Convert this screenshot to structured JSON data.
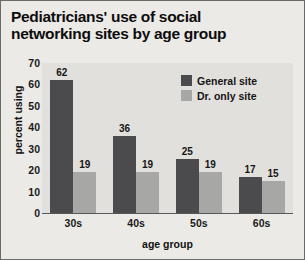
{
  "chart_data": {
    "type": "bar",
    "title": "Pediatricians' use of social networking sites by age group",
    "title_line1": "Pediatricians' use of social",
    "title_line2": "networking sites by age group",
    "xlabel": "age group",
    "ylabel": "percent using",
    "categories": [
      "30s",
      "40s",
      "50s",
      "60s"
    ],
    "series": [
      {
        "name": "General site",
        "color": "#4b4b4d",
        "values": [
          62,
          36,
          25,
          17
        ]
      },
      {
        "name": "Dr. only site",
        "color": "#a7a7a6",
        "values": [
          19,
          19,
          19,
          15
        ]
      }
    ],
    "ylim": [
      0,
      70
    ],
    "yticks": [
      70,
      60,
      50,
      40,
      30,
      20,
      10,
      0
    ],
    "grid": false,
    "legend_position": "top-right",
    "value_labels": true
  },
  "colors": {
    "figure_background": "#eceae7",
    "plot_background": "#e2e0dd",
    "frame": "#6a6a68",
    "axis": "#58585a",
    "text": "#111111"
  }
}
